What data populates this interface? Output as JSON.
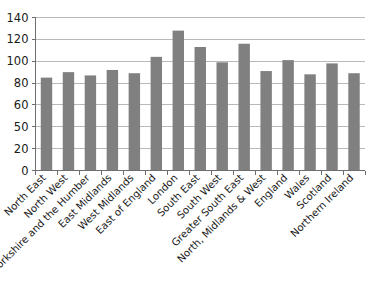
{
  "chart_data": {
    "type": "bar",
    "title": "",
    "subtitle": "",
    "xlabel": "",
    "ylabel": "",
    "orientation": "vertical",
    "grid": "horizontal-only",
    "legend": "none",
    "ylim": [
      0,
      140
    ],
    "y_ticks_as_labeled": [
      "140",
      "120",
      "100",
      "80",
      "60",
      "50",
      "20",
      "0"
    ],
    "y_ticks_numeric_positions": [
      140,
      120,
      100,
      80,
      60,
      40,
      20,
      0
    ],
    "y_axis_note": "Tick marks are evenly spaced at 20-unit intervals, but the fourth tick from the bottom is printed as 50 instead of 40 in the source image.",
    "bar_color": "#808080",
    "gridline_color": "#a8a8a8",
    "axis_color": "#6e6e6e",
    "categories": [
      "North East",
      "North West",
      "Yorkshire and the Humber",
      "East Midlands",
      "West Midlands",
      "East of England",
      "London",
      "South East",
      "South West",
      "Greater South East",
      "North, Midlands & West",
      "England",
      "Wales",
      "Scotland",
      "Northern Ireland"
    ],
    "values": [
      85,
      90,
      87,
      92,
      89,
      104,
      128,
      113,
      99,
      116,
      91,
      101,
      88,
      98,
      89
    ]
  },
  "ghost_caption": {
    "text": ""
  }
}
